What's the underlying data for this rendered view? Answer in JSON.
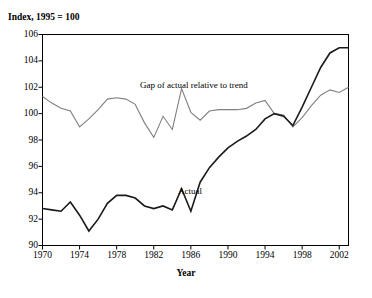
{
  "chart_data": {
    "type": "line",
    "title": "Index, 1995 = 100",
    "xlabel": "Year",
    "ylabel": "Index, 1995 = 100",
    "xlim": [
      1970,
      2003
    ],
    "ylim": [
      90,
      106
    ],
    "ytick_labels": [
      "90",
      "92",
      "94",
      "96",
      "98",
      "100",
      "102",
      "104",
      "106"
    ],
    "yticks": [
      90,
      92,
      94,
      96,
      98,
      100,
      102,
      104,
      106
    ],
    "xtick_labels": [
      "1970",
      "1974",
      "1978",
      "1982",
      "1986",
      "1990",
      "1994",
      "1998",
      "2002"
    ],
    "xticks": [
      1970,
      1974,
      1978,
      1982,
      1986,
      1990,
      1994,
      1998,
      2002
    ],
    "grid": false,
    "legend": "inline-annotations",
    "x": [
      1970,
      1971,
      1972,
      1973,
      1974,
      1975,
      1976,
      1977,
      1978,
      1979,
      1980,
      1981,
      1982,
      1983,
      1984,
      1985,
      1986,
      1987,
      1988,
      1989,
      1990,
      1991,
      1992,
      1993,
      1994,
      1995,
      1996,
      1997,
      1998,
      1999,
      2000,
      2001,
      2002,
      2003
    ],
    "series": [
      {
        "name": "Gap of actual relative to trend",
        "color": "#808080",
        "values": [
          101.3,
          100.8,
          100.4,
          100.2,
          99.0,
          99.6,
          100.3,
          101.1,
          101.2,
          101.1,
          100.7,
          99.3,
          98.2,
          99.8,
          98.8,
          101.9,
          100.1,
          99.5,
          100.2,
          100.3,
          100.3,
          100.3,
          100.4,
          100.8,
          101.0,
          100.0,
          99.9,
          99.0,
          99.7,
          100.6,
          101.4,
          101.8,
          101.6,
          102.0
        ]
      },
      {
        "name": "Actual",
        "color": "#1a1a1a",
        "values": [
          92.8,
          92.7,
          92.6,
          93.3,
          92.3,
          91.1,
          92.0,
          93.2,
          93.8,
          93.8,
          93.6,
          93.0,
          92.8,
          93.0,
          92.7,
          94.3,
          92.6,
          94.8,
          95.9,
          96.7,
          97.4,
          97.9,
          98.3,
          98.8,
          99.6,
          100.0,
          99.8,
          99.1,
          100.5,
          102.0,
          103.5,
          104.6,
          105.0,
          105.0
        ]
      }
    ],
    "annotations": [
      {
        "text": "Gap of actual relative to trend",
        "name": "gap-series-label"
      },
      {
        "text": "Actual",
        "name": "actual-series-label"
      }
    ]
  }
}
